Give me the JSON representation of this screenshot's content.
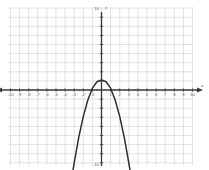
{
  "chart_data": {
    "type": "line",
    "title": "",
    "xlabel": "x",
    "ylabel": "y",
    "xlim": [
      -10,
      10
    ],
    "ylim": [
      -10,
      10
    ],
    "grid": true,
    "grid_step": 1,
    "legend": "none",
    "x_tick_labels": [
      "-10",
      "-9",
      "-8",
      "-7",
      "-6",
      "-5",
      "-4",
      "-3",
      "-2",
      "-1",
      "1",
      "2",
      "3",
      "4",
      "5",
      "6",
      "7",
      "8",
      "9",
      "10"
    ],
    "y_tick_labels": [
      "10",
      "-10"
    ],
    "series": [
      {
        "name": "parabola",
        "equation": "y = -x^2 + 1",
        "vertex": [
          0,
          1
        ],
        "roots": [
          -2.5,
          2.5
        ],
        "opens": "down",
        "arrow_start": [
          -3.3,
          -10
        ],
        "arrow_end": [
          3.3,
          -10
        ],
        "x": [
          -3.3,
          -3.0,
          -2.5,
          -2.0,
          -1.5,
          -1.0,
          -0.5,
          0,
          0.5,
          1.0,
          1.5,
          2.0,
          2.5,
          3.0,
          3.3
        ],
        "y": [
          -9.9,
          -8.0,
          -5.2,
          -2.9,
          -1.1,
          0.2,
          0.9,
          1.1,
          0.9,
          0.2,
          -1.1,
          -2.9,
          -5.2,
          -8.0,
          -9.9
        ]
      }
    ]
  },
  "colors": {
    "grid": "#d5d5d5",
    "axis": "#3a3a3a",
    "curve": "#2f2f2f",
    "background": "#ffffff",
    "tick_text": "#5b5b5b"
  },
  "labels": {
    "x_axis_name": "x",
    "y_axis_name": "y",
    "y_top": "10",
    "y_bottom": "-10"
  }
}
